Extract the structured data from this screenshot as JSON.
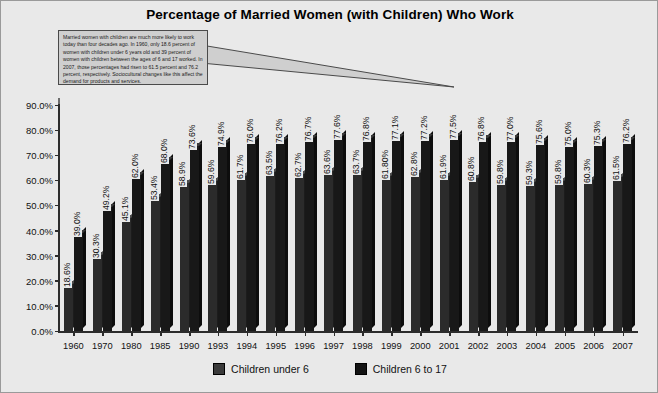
{
  "chart_data": {
    "type": "bar",
    "title": "Percentage of Married Women (with Children) Who Work",
    "xlabel": "",
    "ylabel": "",
    "ylim": [
      0,
      90
    ],
    "ytick_labels": [
      "0.0%",
      "10.0%",
      "20.0%",
      "30.0%",
      "40.0%",
      "50.0%",
      "60.0%",
      "70.0%",
      "80.0%",
      "90.0%"
    ],
    "ytick_values": [
      0,
      10,
      20,
      30,
      40,
      50,
      60,
      70,
      80,
      90
    ],
    "grid": false,
    "legend_position": "bottom",
    "categories": [
      "1960",
      "1970",
      "1980",
      "1985",
      "1990",
      "1993",
      "1994",
      "1995",
      "1996",
      "1997",
      "1998",
      "1999",
      "2000",
      "2001",
      "2002",
      "2003",
      "2004",
      "2005",
      "2006",
      "2007"
    ],
    "series": [
      {
        "name": "Children under 6",
        "values": [
          18.6,
          30.3,
          45.1,
          53.4,
          58.9,
          59.6,
          61.7,
          63.5,
          62.7,
          63.6,
          63.7,
          61.8,
          62.8,
          61.9,
          60.8,
          59.8,
          59.3,
          59.8,
          60.3,
          61.5
        ],
        "labels": [
          "18.6%",
          "30.3%",
          "45.1%",
          "53.4%",
          "58.9%",
          "59.6%",
          "61.7%",
          "63.5%",
          "62.7%",
          "63.6%",
          "63.7%",
          "61.80%",
          "62.8%",
          "61.9%",
          "60.8%",
          "59.8%",
          "59.3%",
          "59.8%",
          "60.3%",
          "61.5%"
        ]
      },
      {
        "name": "Children 6 to 17",
        "values": [
          39.0,
          49.2,
          62.0,
          68.0,
          73.6,
          74.9,
          76.0,
          76.2,
          76.7,
          77.6,
          76.8,
          77.1,
          77.2,
          77.5,
          76.8,
          77.0,
          75.6,
          75.0,
          75.3,
          76.2
        ],
        "labels": [
          "39.0%",
          "49.2%",
          "62.0%",
          "68.0%",
          "73.6%",
          "74.9%",
          "76.0%",
          "76.2%",
          "76.7%",
          "77.6%",
          "76.8%",
          "77.1%",
          "77.2%",
          "77.5%",
          "76.8%",
          "77.0%",
          "75.6%",
          "75.0%",
          "75.3%",
          "76.2%"
        ]
      }
    ],
    "annotation": "Married women with children are much more likely to work today than four decades ago. In 1960, only 18.6 percent of women with children under 6 years old and 39 percent of women with children between the ages of 6 and 17 worked. In 2007, those percentages had risen to 61.5 percent and 76.2 percent, respectively. Sociocultural changes like this affect the demand for products and services.",
    "colors": {
      "background": "#e9e9e9",
      "series_under6": "#2b2b2b",
      "series_6to17": "#181818",
      "axis": "#2c2c2c",
      "callout_bg": "#cfcfcf",
      "text": "#111111"
    }
  }
}
